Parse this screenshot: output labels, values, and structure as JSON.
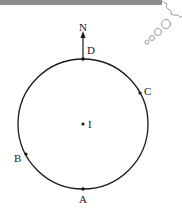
{
  "diagram": {
    "north_label": "N",
    "center_label": "I",
    "points": [
      {
        "id": "D",
        "label": "D"
      },
      {
        "id": "C",
        "label": "C"
      },
      {
        "id": "B",
        "label": "B"
      },
      {
        "id": "A",
        "label": "A"
      }
    ],
    "colors": {
      "stroke": "#1a1a1a",
      "top_bar": "#8c8c8c",
      "bubbles": "#9a9a9a"
    }
  }
}
